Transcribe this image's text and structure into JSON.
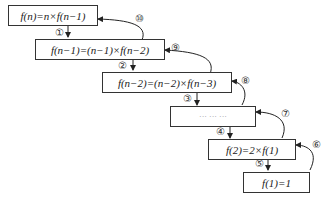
{
  "boxes": [
    {
      "id": "b1",
      "text": "f(n)=n×f(n−1)"
    },
    {
      "id": "b2",
      "text": "f(n−1)=(n−1)×f(n−2)"
    },
    {
      "id": "b3",
      "text": "f(n−2)=(n−2)×f(n−3)"
    },
    {
      "id": "b4",
      "text": "··· ··· ···"
    },
    {
      "id": "b5",
      "text": "f(2)=2×f(1)"
    },
    {
      "id": "b6",
      "text": "f(1)=1"
    }
  ],
  "down_labels": [
    "①",
    "②",
    "③",
    "④",
    "⑤"
  ],
  "up_labels": [
    "⑥",
    "⑦",
    "⑧",
    "⑨",
    "⑩"
  ]
}
